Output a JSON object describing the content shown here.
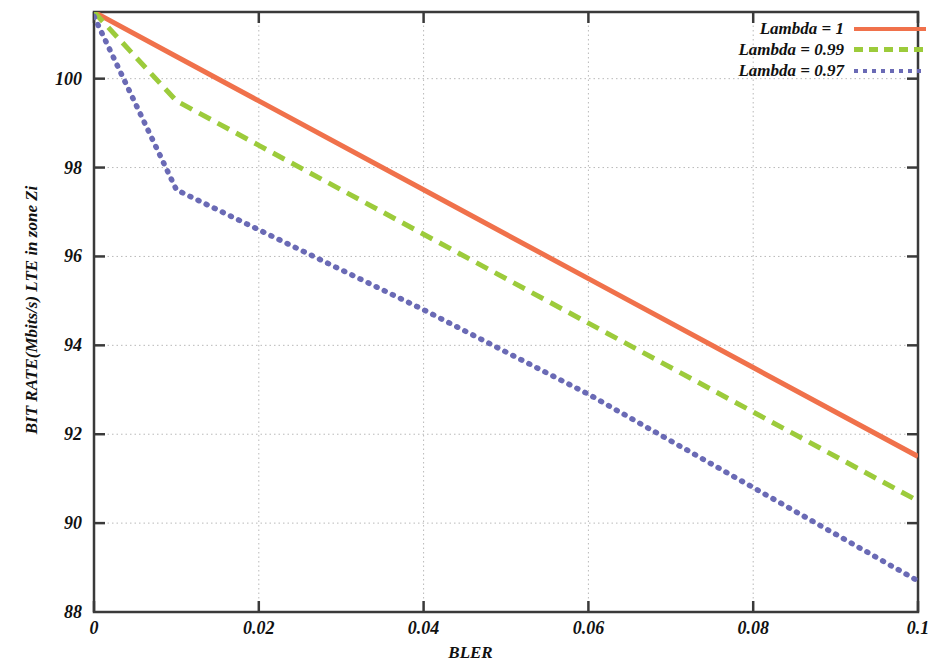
{
  "chart_data": {
    "type": "line",
    "title": "",
    "xlabel": "BLER",
    "ylabel": "BIT RATE(Mbits/s) LTE in zone Zi",
    "xlim": [
      0,
      0.1
    ],
    "ylim": [
      88,
      101.5
    ],
    "xticks": [
      "0",
      "0.02",
      "0.04",
      "0.06",
      "0.08",
      "0.1"
    ],
    "xtick_values": [
      0,
      0.02,
      0.04,
      0.06,
      0.08,
      0.1
    ],
    "yticks": [
      "88",
      "90",
      "92",
      "94",
      "96",
      "98",
      "100"
    ],
    "ytick_values": [
      88,
      90,
      92,
      94,
      96,
      98,
      100
    ],
    "grid": true,
    "legend_position": "top-right",
    "series": [
      {
        "name": "Lambda = 1",
        "color": "#f0714b",
        "style": "solid",
        "x": [
          0,
          0.01,
          0.02,
          0.04,
          0.06,
          0.08,
          0.1
        ],
        "values": [
          101.5,
          100.5,
          99.5,
          97.5,
          95.5,
          93.5,
          91.5
        ]
      },
      {
        "name": "Lambda = 0.99",
        "color": "#9ccb3b",
        "style": "dashed",
        "x": [
          0,
          0.01,
          0.02,
          0.04,
          0.06,
          0.08,
          0.1
        ],
        "values": [
          101.5,
          99.5,
          98.5,
          96.5,
          94.5,
          92.5,
          90.5
        ]
      },
      {
        "name": "Lambda = 0.97",
        "color": "#6a6ab5",
        "style": "dotted",
        "x": [
          0,
          0.01,
          0.02,
          0.04,
          0.06,
          0.08,
          0.1
        ],
        "values": [
          101.4,
          97.5,
          96.6,
          94.8,
          92.9,
          90.8,
          88.7
        ]
      }
    ]
  },
  "legend": {
    "items": [
      {
        "label": "Lambda = 1",
        "style": "solid",
        "color": "#f0714b"
      },
      {
        "label": "Lambda = 0.99",
        "style": "dashed",
        "color": "#9ccb3b"
      },
      {
        "label": "Lambda = 0.97",
        "style": "dotted",
        "color": "#6a6ab5"
      }
    ]
  },
  "axes": {
    "x_title": "BLER",
    "y_title": "BIT RATE(Mbits/s) LTE in zone Zi"
  }
}
